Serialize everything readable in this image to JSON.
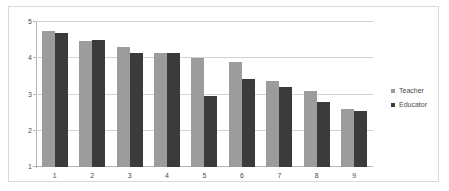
{
  "chart_data": {
    "type": "bar",
    "title": "",
    "xlabel": "",
    "ylabel": "",
    "categories": [
      "1",
      "2",
      "3",
      "4",
      "5",
      "6",
      "7",
      "8",
      "9"
    ],
    "series": [
      {
        "name": "Teacher",
        "color": "#9c9c9c",
        "values": [
          4.75,
          4.47,
          4.31,
          4.15,
          4.01,
          3.9,
          3.38,
          3.11,
          2.6
        ]
      },
      {
        "name": "Educator",
        "color": "#3b3b3b",
        "values": [
          4.71,
          4.51,
          4.14,
          4.15,
          2.95,
          3.42,
          3.22,
          2.78,
          2.55
        ]
      }
    ],
    "ylim": [
      1,
      5
    ],
    "yticks": [
      "5",
      "4",
      "3",
      "2",
      "1"
    ],
    "grid": true,
    "legend_position": "right"
  }
}
